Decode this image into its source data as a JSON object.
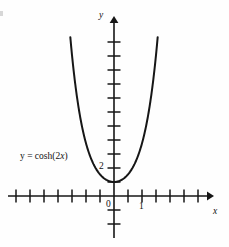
{
  "figure": {
    "width": 229,
    "height": 247,
    "background_color": "#fefefe",
    "ink_color": "#161616"
  },
  "labels": {
    "y_axis": "y",
    "x_axis": "x",
    "origin": "0",
    "x_tick_one": "1",
    "y_tick_two": "2",
    "equation_lhs": "y = ",
    "equation_fn": "cosh(2",
    "equation_var": "x",
    "equation_close": ")"
  },
  "chart_data": {
    "type": "line",
    "title": "",
    "subtitle": "",
    "xlabel": "x",
    "ylabel": "y",
    "annotations": [
      {
        "text": "y = cosh(2x)",
        "x": -1.95,
        "y": 2.8,
        "role": "curve-label"
      }
    ],
    "legend": [],
    "legend_position": "none",
    "grid": false,
    "axes_style": "arrowed-number-line",
    "xlim": [
      -3.8,
      3.5
    ],
    "ylim": [
      -3.0,
      12.7
    ],
    "xticks": [
      -3.5,
      -3.0,
      -2.5,
      -2.0,
      -1.5,
      -1.0,
      -0.5,
      0.5,
      1.0,
      1.5,
      2.0,
      2.5,
      3.0
    ],
    "xtick_labels": {
      "0": "0",
      "1": "1"
    },
    "xtick_spacing": 0.5,
    "yticks": [
      -2,
      -1,
      1,
      2,
      3,
      4,
      5,
      6,
      7,
      8,
      9,
      10,
      11
    ],
    "ytick_labels": {
      "2": "2"
    },
    "ytick_spacing": 1,
    "series": [
      {
        "name": "y = cosh(2x)",
        "formula": "cosh(2x)",
        "x_domain": [
          -1.56,
          1.56
        ],
        "minimum": {
          "x": 0,
          "y": 1
        },
        "color": "#161616",
        "linewidth": 2.0,
        "x": [
          -1.56,
          -1.45,
          -1.35,
          -1.25,
          -1.15,
          -1.05,
          -0.95,
          -0.85,
          -0.75,
          -0.65,
          -0.55,
          -0.45,
          -0.35,
          -0.25,
          -0.15,
          -0.05,
          0.05,
          0.15,
          0.25,
          0.35,
          0.45,
          0.55,
          0.65,
          0.75,
          0.85,
          0.95,
          1.05,
          1.15,
          1.25,
          1.35,
          1.45,
          1.56
        ],
        "values": [
          11.4,
          9.18,
          7.52,
          6.16,
          5.05,
          4.14,
          3.42,
          2.83,
          2.35,
          1.97,
          1.67,
          1.43,
          1.25,
          1.13,
          1.05,
          1.0,
          1.0,
          1.05,
          1.13,
          1.25,
          1.43,
          1.67,
          1.97,
          2.35,
          2.83,
          3.42,
          4.14,
          5.05,
          6.16,
          7.52,
          9.18,
          11.4
        ]
      }
    ]
  }
}
